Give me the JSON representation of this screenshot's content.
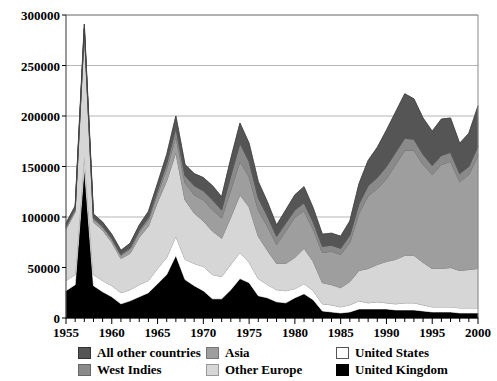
{
  "chart_data": {
    "type": "area",
    "stacked": true,
    "title": "",
    "xlabel": "",
    "ylabel": "",
    "xlim": [
      1955,
      2000
    ],
    "ylim": [
      0,
      300000
    ],
    "ytick_labels": [
      "0",
      "50000",
      "100000",
      "150000",
      "200000",
      "250000",
      "300000"
    ],
    "ytick_values": [
      0,
      50000,
      100000,
      150000,
      200000,
      250000,
      300000
    ],
    "xtick_labels": [
      "1955",
      "1960",
      "1965",
      "1970",
      "1975",
      "1980",
      "1985",
      "1990",
      "1995",
      "2000"
    ],
    "xtick_values": [
      1955,
      1960,
      1965,
      1970,
      1975,
      1980,
      1985,
      1990,
      1995,
      2000
    ],
    "grid": "horizontal",
    "legend_position": "bottom",
    "x": [
      1955,
      1956,
      1957,
      1958,
      1959,
      1960,
      1961,
      1962,
      1963,
      1964,
      1965,
      1966,
      1967,
      1968,
      1969,
      1970,
      1971,
      1972,
      1973,
      1974,
      1975,
      1976,
      1977,
      1978,
      1979,
      1980,
      1981,
      1982,
      1983,
      1984,
      1985,
      1986,
      1987,
      1988,
      1989,
      1990,
      1991,
      1992,
      1993,
      1994,
      1995,
      1996,
      1997,
      1998,
      1999,
      2000
    ],
    "series": [
      {
        "name": "United Kingdom",
        "color": "#000000",
        "values": [
          27000,
          33000,
          150000,
          32000,
          26000,
          21000,
          14000,
          17000,
          21000,
          25000,
          34000,
          43000,
          62000,
          38000,
          32000,
          27000,
          19000,
          19000,
          28000,
          39000,
          35000,
          22000,
          20000,
          16000,
          15000,
          20000,
          24000,
          18000,
          7000,
          6000,
          5000,
          6000,
          9000,
          9000,
          9000,
          9000,
          8000,
          8000,
          8000,
          7000,
          6000,
          6000,
          6000,
          5000,
          5000,
          5000
        ]
      },
      {
        "name": "United States",
        "color": "#ffffff",
        "values": [
          10000,
          10000,
          11000,
          11000,
          11000,
          11000,
          11000,
          11000,
          12000,
          12000,
          15000,
          17000,
          19000,
          20000,
          22000,
          24000,
          24000,
          22000,
          25000,
          26000,
          20000,
          17000,
          13000,
          12000,
          12000,
          9000,
          10000,
          9000,
          7000,
          7000,
          6000,
          7000,
          8000,
          6000,
          7000,
          6000,
          6000,
          7000,
          7000,
          6000,
          5000,
          5000,
          5000,
          5000,
          5000,
          5000
        ]
      },
      {
        "name": "Other Europe",
        "color": "#d6d6d6",
        "values": [
          51000,
          62000,
          122000,
          52000,
          50000,
          43000,
          34000,
          36000,
          47000,
          54000,
          66000,
          76000,
          83000,
          59000,
          50000,
          45000,
          43000,
          38000,
          47000,
          57000,
          55000,
          42000,
          34000,
          26000,
          27000,
          31000,
          35000,
          29000,
          21000,
          20000,
          19000,
          23000,
          30000,
          34000,
          37000,
          41000,
          44000,
          47000,
          47000,
          42000,
          38000,
          38000,
          39000,
          37000,
          38000,
          39000
        ]
      },
      {
        "name": "Asia",
        "color": "#9e9e9e",
        "values": [
          2000,
          2000,
          3000,
          3000,
          3000,
          3000,
          3000,
          4000,
          5000,
          6000,
          8000,
          12000,
          16000,
          17000,
          18000,
          21000,
          21000,
          20000,
          27000,
          33000,
          30000,
          26000,
          24000,
          19000,
          32000,
          40000,
          37000,
          32000,
          30000,
          33000,
          33000,
          39000,
          57000,
          72000,
          75000,
          82000,
          94000,
          104000,
          104000,
          97000,
          93000,
          103000,
          105000,
          88000,
          94000,
          112000
        ]
      },
      {
        "name": "West Indies",
        "color": "#8a8a8a",
        "values": [
          1000,
          1000,
          1000,
          1000,
          1000,
          1000,
          1000,
          1500,
          2000,
          2500,
          3500,
          5000,
          8000,
          7000,
          9000,
          9000,
          10000,
          8000,
          14000,
          18000,
          15000,
          12000,
          10000,
          8000,
          8000,
          7000,
          8000,
          7000,
          6000,
          6000,
          6000,
          7000,
          9000,
          10000,
          11000,
          12000,
          12000,
          12000,
          11000,
          10000,
          9000,
          9000,
          9000,
          8000,
          8000,
          9000
        ]
      },
      {
        "name": "All other countries",
        "color": "#555555",
        "values": [
          3000,
          3000,
          4000,
          4000,
          4000,
          4000,
          4000,
          4500,
          5000,
          6000,
          7000,
          9000,
          12000,
          11000,
          12000,
          13000,
          14000,
          13000,
          17000,
          20000,
          18000,
          16000,
          14000,
          11000,
          13000,
          15000,
          16000,
          14000,
          12000,
          12000,
          12000,
          14000,
          20000,
          25000,
          30000,
          36000,
          40000,
          44000,
          40000,
          36000,
          34000,
          36000,
          34000,
          30000,
          33000,
          40000
        ]
      }
    ]
  },
  "legend": {
    "items": [
      {
        "label": "All other countries",
        "color": "#555555",
        "border": "#333333"
      },
      {
        "label": "Asia",
        "color": "#9e9e9e",
        "border": "#777777"
      },
      {
        "label": "United States",
        "color": "#ffffff",
        "border": "#555555"
      },
      {
        "label": "West Indies",
        "color": "#8a8a8a",
        "border": "#666666"
      },
      {
        "label": "Other Europe",
        "color": "#d6d6d6",
        "border": "#999999"
      },
      {
        "label": "United Kingdom",
        "color": "#000000",
        "border": "#000000"
      }
    ]
  },
  "axes": {
    "frame_color": "#888888",
    "grid_color": "#b5b5b5",
    "tick_color": "#000000"
  }
}
